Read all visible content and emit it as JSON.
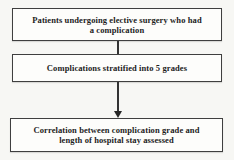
{
  "flowchart": {
    "boxes": [
      {
        "id": "patients",
        "lines": [
          "Patients undergoing elective surgery who had",
          "a complication"
        ]
      },
      {
        "id": "grades",
        "lines": [
          "Complications stratified into 5 grades"
        ]
      },
      {
        "id": "correlation",
        "lines": [
          "Correlation between complication grade and",
          "length of hospital stay assessed"
        ]
      }
    ],
    "connectors": [
      {
        "from": "patients",
        "to": "grades",
        "type": "line"
      },
      {
        "from": "grades",
        "to": "correlation",
        "type": "arrow-down"
      }
    ],
    "colors": {
      "page_background": "#f7f7f4",
      "box_background": "#fdfdfb",
      "border": "#3f3f3f",
      "text": "#1c1c1c",
      "arrow": "#262626"
    }
  }
}
